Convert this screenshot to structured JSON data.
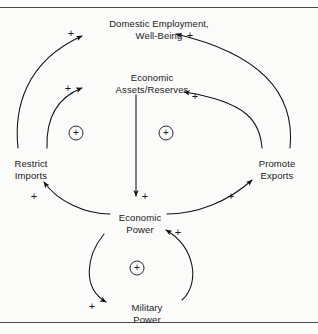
{
  "figure": {
    "type": "causal-loop-diagram",
    "background_color": "#fbfbfa",
    "line_color": "#1a1a1a",
    "rules": {
      "top_label": "top-rule",
      "bottom_label": "bottom-rule"
    }
  },
  "nodes": [
    {
      "id": "domestic-employment",
      "line1": "Domestic Employment,",
      "line2": "Well-Being",
      "x": 159,
      "y": 18
    },
    {
      "id": "economic-assets",
      "line1": "Economic",
      "line2": "Assets/Reserves",
      "x": 152,
      "y": 72
    },
    {
      "id": "restrict-imports",
      "line1": "Restrict",
      "line2": "Imports",
      "x": 31,
      "y": 158
    },
    {
      "id": "promote-exports",
      "line1": "Promote",
      "line2": "Exports",
      "x": 277,
      "y": 158
    },
    {
      "id": "economic-power",
      "line1": "Economic",
      "line2": "Power",
      "x": 140,
      "y": 212
    },
    {
      "id": "military-power",
      "line1": "Military",
      "line2": "Power",
      "x": 147,
      "y": 302
    }
  ],
  "loop_markers": [
    {
      "id": "loop-left",
      "symbol": "+",
      "polarity": "reinforcing",
      "x": 76,
      "y": 133
    },
    {
      "id": "loop-right",
      "symbol": "+",
      "polarity": "reinforcing",
      "x": 166,
      "y": 133
    },
    {
      "id": "loop-bottom",
      "symbol": "+",
      "polarity": "reinforcing",
      "x": 137,
      "y": 268
    }
  ],
  "link_labels": [
    {
      "id": "plus-imports-to-employment",
      "symbol": "+",
      "x": 71,
      "y": 33
    },
    {
      "id": "plus-exports-to-employment",
      "symbol": "+",
      "x": 190,
      "y": 35
    },
    {
      "id": "plus-imports-to-assets",
      "symbol": "+",
      "x": 68,
      "y": 88
    },
    {
      "id": "plus-exports-to-assets",
      "symbol": "+",
      "x": 195,
      "y": 96
    },
    {
      "id": "plus-assets-to-power",
      "symbol": "+",
      "x": 145,
      "y": 196
    },
    {
      "id": "plus-power-to-imports",
      "symbol": "+",
      "x": 34,
      "y": 196
    },
    {
      "id": "plus-power-to-exports",
      "symbol": "+",
      "x": 231,
      "y": 196
    },
    {
      "id": "plus-military-to-power",
      "symbol": "+",
      "x": 178,
      "y": 232
    },
    {
      "id": "plus-power-to-military",
      "symbol": "+",
      "x": 92,
      "y": 306
    }
  ],
  "links": [
    {
      "id": "restrict-imports-to-domestic-employment",
      "from": "restrict-imports",
      "to": "domestic-employment",
      "polarity": "+"
    },
    {
      "id": "restrict-imports-to-economic-assets",
      "from": "restrict-imports",
      "to": "economic-assets",
      "polarity": "+"
    },
    {
      "id": "promote-exports-to-domestic-employment",
      "from": "promote-exports",
      "to": "domestic-employment",
      "polarity": "+"
    },
    {
      "id": "promote-exports-to-economic-assets",
      "from": "promote-exports",
      "to": "economic-assets",
      "polarity": "+"
    },
    {
      "id": "economic-assets-to-economic-power",
      "from": "economic-assets",
      "to": "economic-power",
      "polarity": "+"
    },
    {
      "id": "economic-power-to-restrict-imports",
      "from": "economic-power",
      "to": "restrict-imports",
      "polarity": "+"
    },
    {
      "id": "economic-power-to-promote-exports",
      "from": "economic-power",
      "to": "promote-exports",
      "polarity": "+"
    },
    {
      "id": "economic-power-to-military-power",
      "from": "economic-power",
      "to": "military-power",
      "polarity": "+"
    },
    {
      "id": "military-power-to-economic-power",
      "from": "military-power",
      "to": "economic-power",
      "polarity": "+"
    }
  ]
}
